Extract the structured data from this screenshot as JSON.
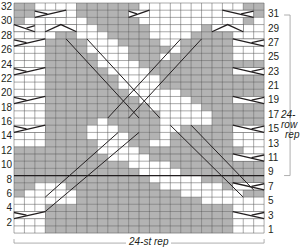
{
  "chart_title": "",
  "grid": {
    "cols": 24,
    "rows": 32,
    "x0": 14,
    "y0": 3,
    "cell_w": 10.42,
    "cell_h": 7.19,
    "colors": {
      "purl": "#b3b3b3",
      "knit": "#ffffff",
      "grid_line": "#555555",
      "cable_line": "#231f20",
      "bold_line": "#231f20"
    },
    "shading_top_to_bottom": [
      "110000111111000000000011",
      "110000111111000000000011",
      "100000011111000000000010",
      "000000001111100000110000",
      "000011000111100001111000",
      "000111100011110011111000",
      "000111100001111011111000",
      "000111110001110111111000",
      "000111110000111111111111",
      "000111111000011111111111",
      "000111111100001111111111",
      "000111111100001111111111",
      "000111111110000011111111",
      "000111111111000001111111",
      "000111111111100000111111",
      "000111111111110000011111",
      "000111110111110000011111",
      "000111100011110011111000",
      "000111100001110111111000",
      "000111110001100111111000",
      "111111110000111111111100",
      "111111111000011111111110",
      "111111111110000111111111",
      "111111111111000011111111",
      "111111111111100000111111",
      "110001111111110000001111",
      "100000111111111100000011",
      "000000111111111111000000",
      "000111111111111111111000",
      "000111111111111111111000",
      "000111111111111111111000",
      "000111111111111111111000"
    ],
    "bold_row_line_above_row": 8,
    "cables": [
      {
        "row": 31,
        "cols": [
          3,
          5
        ],
        "dir": "right"
      },
      {
        "row": 31,
        "cols": [
          12,
          13
        ],
        "dir": "right"
      },
      {
        "row": 31,
        "cols": [
          21,
          23
        ],
        "dir": "left"
      },
      {
        "row": 29,
        "cols": [
          1,
          2
        ],
        "dir": "left"
      },
      {
        "row": 29,
        "cols": [
          4,
          6
        ],
        "dir": "peak"
      },
      {
        "row": 29,
        "cols": [
          20,
          22
        ],
        "dir": "peak"
      },
      {
        "row": 27,
        "cols": [
          1,
          3
        ],
        "dir": "right"
      },
      {
        "row": 27,
        "cols": [
          22,
          24
        ],
        "dir": "left"
      },
      {
        "row": 23,
        "cols": [
          1,
          3
        ],
        "dir": "right"
      },
      {
        "row": 23,
        "cols": [
          22,
          24
        ],
        "dir": "left"
      },
      {
        "row": 19,
        "cols": [
          1,
          3
        ],
        "dir": "right"
      },
      {
        "row": 19,
        "cols": [
          22,
          24
        ],
        "dir": "left"
      },
      {
        "row": 15,
        "cols": [
          1,
          3
        ],
        "dir": "right"
      },
      {
        "row": 15,
        "cols": [
          22,
          24
        ],
        "dir": "left"
      },
      {
        "row": 11,
        "cols": [
          22,
          24
        ],
        "dir": "left"
      },
      {
        "row": 7,
        "cols": [
          22,
          24
        ],
        "dir": "left"
      },
      {
        "row": 3,
        "cols": [
          1,
          3
        ],
        "dir": "right"
      },
      {
        "row": 3,
        "cols": [
          22,
          24
        ],
        "dir": "left"
      }
    ],
    "diagonals": [
      {
        "from": [
          6,
          28
        ],
        "to": [
          13,
          17
        ]
      },
      {
        "from": [
          8,
          28
        ],
        "to": [
          15,
          17
        ]
      },
      {
        "from": [
          19,
          28
        ],
        "to": [
          12,
          17
        ]
      },
      {
        "from": [
          17,
          28
        ],
        "to": [
          10,
          17
        ]
      },
      {
        "from": [
          4,
          6
        ],
        "to": [
          11,
          15
        ]
      },
      {
        "from": [
          4,
          4
        ],
        "to": [
          13,
          15
        ]
      },
      {
        "from": [
          16,
          16
        ],
        "to": [
          23,
          6
        ]
      },
      {
        "from": [
          18,
          16
        ],
        "to": [
          24,
          7
        ]
      }
    ]
  },
  "labels_left": [
    "32",
    "30",
    "28",
    "26",
    "24",
    "22",
    "20",
    "18",
    "16",
    "14",
    "12",
    "10",
    "8",
    "6",
    "4",
    "2"
  ],
  "labels_right": [
    "31",
    "29",
    "27",
    "25",
    "23",
    "21",
    "19",
    "17",
    "15",
    "13",
    "11",
    "9",
    "7",
    "5",
    "3",
    "1"
  ],
  "row_rep_label": "24-row rep",
  "row_rep_label_line1": "24-row",
  "row_rep_label_line2": "rep",
  "st_rep_label": "24-st rep",
  "chart_data": {
    "type": "table",
    "xlabel": "24-st rep",
    "ylabel": "24-row rep",
    "rows_total": 32,
    "stitches_total": 24,
    "row_repeat": [
      9,
      32
    ],
    "stitch_repeat": [
      1,
      24
    ],
    "left_tick_labels": [
      2,
      4,
      6,
      8,
      10,
      12,
      14,
      16,
      18,
      20,
      22,
      24,
      26,
      28,
      30,
      32
    ],
    "right_tick_labels": [
      1,
      3,
      5,
      7,
      9,
      11,
      13,
      15,
      17,
      19,
      21,
      23,
      25,
      27,
      29,
      31
    ],
    "legend": {
      "gray": "purl",
      "white": "knit",
      "diagonal": "cable crossing"
    }
  }
}
